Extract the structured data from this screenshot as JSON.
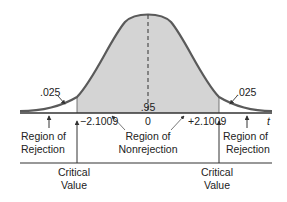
{
  "diagram": {
    "type": "two-tailed t distribution rejection regions",
    "colors": {
      "curve": "#5a5a5a",
      "shade": "#d4d4d4",
      "text": "#222222",
      "background": "#ffffff"
    },
    "labels": {
      "left_tail_area": ".025",
      "right_tail_area": ".025",
      "center_area": ".95",
      "left_critical": "−2.1009",
      "center": "0",
      "right_critical": "+2.1009",
      "axis_var": "t",
      "left_region_line1": "Region of",
      "left_region_line2": "Rejection",
      "center_region_line1": "Region of",
      "center_region_line2": "Nonrejection",
      "right_region_line1": "Region of",
      "right_region_line2": "Rejection",
      "left_cv_line1": "Critical",
      "left_cv_line2": "Value",
      "right_cv_line1": "Critical",
      "right_cv_line2": "Value"
    }
  }
}
